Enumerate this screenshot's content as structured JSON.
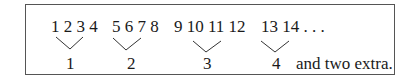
{
  "groups": [
    {
      "numbers": "1 2 3 4",
      "label": "1"
    },
    {
      "numbers": "5 6 7 8",
      "label": "2"
    },
    {
      "numbers": "9 10 11 12",
      "label": "3"
    },
    {
      "numbers": "13 14 . . .",
      "label": "4"
    }
  ],
  "note": "and two extra."
}
